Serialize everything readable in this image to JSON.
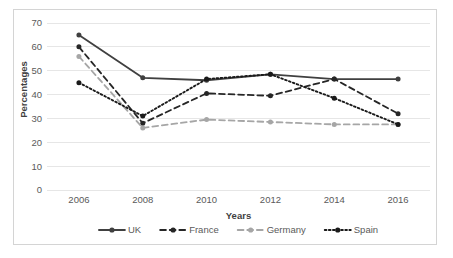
{
  "chart_data": {
    "type": "line",
    "title": "",
    "xlabel": "Years",
    "ylabel": "Percentages",
    "categories": [
      "2006",
      "2008",
      "2010",
      "2012",
      "2014",
      "2016"
    ],
    "ylim": [
      0,
      70
    ],
    "yticks": [
      "0",
      "10",
      "20",
      "30",
      "40",
      "50",
      "60",
      "70"
    ],
    "grid": "horizontal",
    "legend_position": "bottom",
    "series": [
      {
        "name": "UK",
        "values": [
          65,
          47,
          46,
          48.5,
          46.5,
          46.5
        ],
        "color": "#404040",
        "line_style": "solid",
        "marker": "circle"
      },
      {
        "name": "France",
        "values": [
          60,
          28,
          40.5,
          39.5,
          46.5,
          32
        ],
        "color": "#262626",
        "line_style": "dashed",
        "marker": "circle"
      },
      {
        "name": "Germany",
        "values": [
          56,
          26,
          29.5,
          28.5,
          27.5,
          27.5
        ],
        "color": "#a6a6a6",
        "line_style": "dashed",
        "marker": "circle"
      },
      {
        "name": "Spain",
        "values": [
          45,
          31,
          46.5,
          48.5,
          38.5,
          27.5
        ],
        "color": "#1a1a1a",
        "line_style": "dotted",
        "marker": "circle"
      }
    ]
  },
  "axes": {
    "y_title": "Percentages",
    "x_title": "Years"
  },
  "legend": {
    "items": [
      {
        "label": "UK"
      },
      {
        "label": "France"
      },
      {
        "label": "Germany"
      },
      {
        "label": "Spain"
      }
    ]
  }
}
